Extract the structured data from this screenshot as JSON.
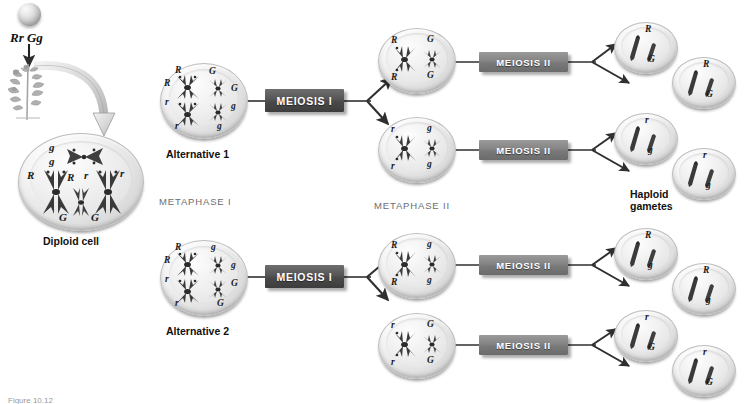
{
  "figure": {
    "genotype_label": "Rr Gg",
    "diploid_label": "Diploid cell",
    "alternative_1": "Alternative 1",
    "alternative_2": "Alternative 2",
    "metaphase_1": "METAPHASE I",
    "metaphase_2": "METAPHASE II",
    "haploid_line1": "Haploid",
    "haploid_line2": "gametes",
    "meiosis_1": "MEIOSIS I",
    "meiosis_2": "MEIOSIS II",
    "caption": "Figure 10.12"
  },
  "alleles": {
    "R_dom": "R",
    "R_rec": "r",
    "G_dom": "G",
    "G_rec": "g"
  },
  "diploid_cell": {
    "top_left": "g",
    "top_left2": "g",
    "left_a": "R",
    "left_b": "R",
    "right_a": "r",
    "right_b": "r",
    "bottom_a": "G",
    "bottom_b": "G"
  },
  "alternative1_metaphase1": {
    "upper_left": "R",
    "lower_left_of_pair": "R",
    "left_rec_a": "r",
    "left_rec_b": "r",
    "upper_right": "G",
    "right_dom_b": "G",
    "right_rec_a": "g",
    "right_rec_b": "g"
  },
  "alternative2_metaphase1": {
    "upper_left": "R",
    "lower_left_of_pair": "R",
    "left_rec_a": "r",
    "left_rec_b": "r",
    "upper_right": "g",
    "right_rec_b": "g",
    "right_dom_a": "G",
    "right_dom_b": "G"
  },
  "metaphase2_cells": [
    {
      "name": "a1-top",
      "left_top": "R",
      "left_bottom": "R",
      "right_top": "G",
      "right_bottom": "G"
    },
    {
      "name": "a1-bottom",
      "left_top": "r",
      "left_bottom": "r",
      "right_top": "g",
      "right_bottom": "g"
    },
    {
      "name": "a2-top",
      "left_top": "R",
      "left_bottom": "R",
      "right_top": "g",
      "right_bottom": "g"
    },
    {
      "name": "a2-bottom",
      "left_top": "r",
      "left_bottom": "r",
      "right_top": "G",
      "right_bottom": "G"
    }
  ],
  "gametes": [
    {
      "name": "gamete-1",
      "big": "R",
      "small": "G"
    },
    {
      "name": "gamete-2",
      "big": "R",
      "small": "G"
    },
    {
      "name": "gamete-3",
      "big": "r",
      "small": "g"
    },
    {
      "name": "gamete-4",
      "big": "r",
      "small": "g"
    },
    {
      "name": "gamete-5",
      "big": "R",
      "small": "g"
    },
    {
      "name": "gamete-6",
      "big": "R",
      "small": "g"
    },
    {
      "name": "gamete-7",
      "big": "r",
      "small": "G"
    },
    {
      "name": "gamete-8",
      "big": "r",
      "small": "G"
    }
  ],
  "colors": {
    "meiosis1_box": "#4a4a4a",
    "meiosis2_box": "#797979",
    "chromosome_dark": "#3a3a3a",
    "chromosome_mid": "#555555",
    "phase_label": "#6d6d6d",
    "background": "#ffffff"
  }
}
